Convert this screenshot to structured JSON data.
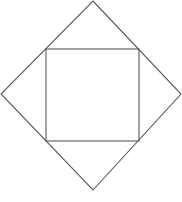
{
  "diagram": {
    "type": "geometric-figure",
    "stroke_color": "#5a5a5a",
    "background": "#ffffff",
    "outer_diamond": {
      "points": [
        [
          93,
          1
        ],
        [
          181,
          94
        ],
        [
          93,
          190
        ],
        [
          1,
          94
        ]
      ]
    },
    "inner_square": {
      "x": 46,
      "y": 49,
      "width": 93,
      "height": 92
    }
  }
}
